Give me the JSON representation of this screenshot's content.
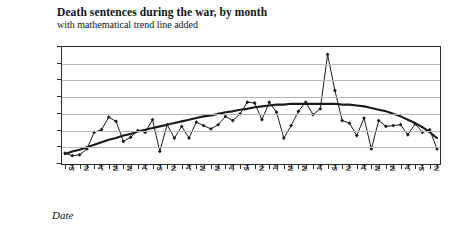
{
  "chart_data": {
    "type": "line",
    "title": "Death sentences during the war, by month",
    "subtitle": "with mathematical trend line added",
    "xlabel": "Date",
    "ylabel": "Cumulative total sentences",
    "ylim": [
      0,
      140
    ],
    "ytick_values": [
      0,
      20,
      40,
      60,
      80,
      100,
      120,
      140
    ],
    "grid": "horizontal",
    "legend": "none",
    "x_tick_step_months": 2,
    "xtick_labels": [
      "Sep-14",
      "Nov-14",
      "Jan-15",
      "Mar-15",
      "May-15",
      "Jul-15",
      "Sep-15",
      "Nov-15",
      "Jan-16",
      "Mar-16",
      "May-16",
      "Jul-16",
      "Sep-16",
      "Nov-16",
      "Jan-17",
      "Mar-17",
      "May-17",
      "Jul-17",
      "Sep-17",
      "Nov-17",
      "Jan-18",
      "Mar-18",
      "May-18",
      "Jul-18",
      "Sep-18",
      "Nov-18"
    ],
    "x": [
      "Sep-14",
      "Oct-14",
      "Nov-14",
      "Dec-14",
      "Jan-15",
      "Feb-15",
      "Mar-15",
      "Apr-15",
      "May-15",
      "Jun-15",
      "Jul-15",
      "Aug-15",
      "Sep-15",
      "Oct-15",
      "Nov-15",
      "Dec-15",
      "Jan-16",
      "Feb-16",
      "Mar-16",
      "Apr-16",
      "May-16",
      "Jun-16",
      "Jul-16",
      "Aug-16",
      "Sep-16",
      "Oct-16",
      "Nov-16",
      "Dec-16",
      "Jan-17",
      "Feb-17",
      "Mar-17",
      "Apr-17",
      "May-17",
      "Jun-17",
      "Jul-17",
      "Aug-17",
      "Sep-17",
      "Oct-17",
      "Nov-17",
      "Dec-17",
      "Jan-18",
      "Feb-18",
      "Mar-18",
      "Apr-18",
      "May-18",
      "Jun-18",
      "Jul-18",
      "Aug-18",
      "Sep-18",
      "Oct-18",
      "Nov-18",
      "Dec-18"
    ],
    "series": [
      {
        "name": "Death sentences per month",
        "marker": "diamond",
        "color": "#1a1a1a",
        "values": [
          13,
          10,
          11,
          18,
          38,
          41,
          56,
          51,
          27,
          32,
          40,
          38,
          53,
          15,
          47,
          31,
          45,
          31,
          50,
          46,
          42,
          47,
          57,
          52,
          60,
          74,
          73,
          53,
          74,
          62,
          31,
          46,
          63,
          74,
          59,
          66,
          131,
          88,
          52,
          49,
          34,
          55,
          18,
          52,
          45,
          46,
          47,
          35,
          48,
          38,
          41,
          18
        ]
      },
      {
        "name": "mathematical trend line",
        "type": "trend",
        "color": "#1a1a1a",
        "values": [
          12,
          15,
          17,
          20,
          23,
          26,
          29,
          31,
          34,
          36,
          39,
          41,
          43,
          45,
          47,
          49,
          51,
          53,
          55,
          57,
          58,
          60,
          62,
          63,
          65,
          66,
          68,
          69,
          70,
          71,
          71,
          72,
          72,
          72,
          72,
          72,
          72,
          72,
          71,
          71,
          70,
          69,
          67,
          65,
          63,
          60,
          57,
          53,
          49,
          44,
          38,
          31
        ]
      }
    ]
  }
}
